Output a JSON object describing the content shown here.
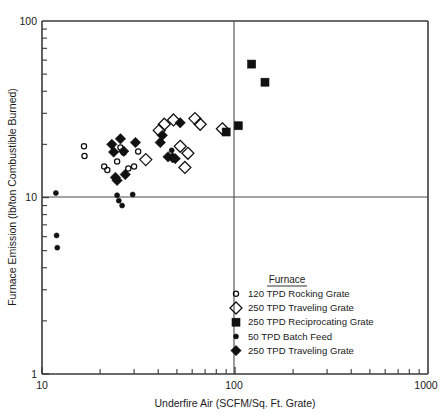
{
  "chart_data": {
    "type": "scatter",
    "title": "",
    "xlabel": "Underfire Air (SCFM/Sq. Ft. Grate)",
    "ylabel": "Furnace Emission (lb/ton Combustible Burned)",
    "xscale": "log",
    "yscale": "log",
    "xlim": [
      10,
      1000
    ],
    "ylim": [
      1,
      100
    ],
    "xticklabels": [
      "10",
      "100",
      "1000"
    ],
    "yticklabels": [
      "1",
      "10",
      "100"
    ],
    "grid": false,
    "reference_lines": [
      {
        "orientation": "vertical",
        "value": 100
      },
      {
        "orientation": "horizontal",
        "value": 10
      }
    ],
    "legend_title": "Furnace",
    "legend_position": "lower-right-inside",
    "series": [
      {
        "name": "120 TPD Rocking Grate",
        "marker": "open-circle",
        "points": [
          [
            16.5,
            19.5
          ],
          [
            16.6,
            17.2
          ],
          [
            21.0,
            15.0
          ],
          [
            21.8,
            14.3
          ],
          [
            24.5,
            16.0
          ],
          [
            25.5,
            19.2
          ],
          [
            26.5,
            18.0
          ],
          [
            28.0,
            14.6
          ],
          [
            30.0,
            15.0
          ],
          [
            31.5,
            18.2
          ]
        ]
      },
      {
        "name": "250 TPD Traveling Grate",
        "marker": "open-diamond",
        "points": [
          [
            34.5,
            16.4
          ],
          [
            40.5,
            24.0
          ],
          [
            43.0,
            26.0
          ],
          [
            48.0,
            27.5
          ],
          [
            52.0,
            19.5
          ],
          [
            55.0,
            14.8
          ],
          [
            57.0,
            17.8
          ],
          [
            62.0,
            28.0
          ],
          [
            66.0,
            26.0
          ],
          [
            86.0,
            24.5
          ]
        ]
      },
      {
        "name": "250 TPD Reciprocating Grate",
        "marker": "filled-square",
        "points": [
          [
            90.0,
            23.5
          ],
          [
            104.0,
            25.5
          ],
          [
            122.0,
            57.0
          ],
          [
            143.0,
            45.0
          ]
        ]
      },
      {
        "name": "50 TPD Batch Feed",
        "marker": "small-dot",
        "points": [
          [
            11.8,
            10.6
          ],
          [
            11.9,
            6.1
          ],
          [
            12.0,
            5.2
          ],
          [
            24.5,
            10.3
          ],
          [
            25.0,
            9.6
          ],
          [
            26.0,
            9.0
          ],
          [
            29.5,
            10.4
          ],
          [
            47.0,
            18.5
          ]
        ]
      },
      {
        "name": "250 TPD Traveling Grate",
        "marker": "filled-diamond",
        "points": [
          [
            23.0,
            20.0
          ],
          [
            23.5,
            18.1
          ],
          [
            24.0,
            13.0
          ],
          [
            24.5,
            12.5
          ],
          [
            25.5,
            21.5
          ],
          [
            26.5,
            18.3
          ],
          [
            27.0,
            13.5
          ],
          [
            30.5,
            20.5
          ],
          [
            41.0,
            20.5
          ],
          [
            42.0,
            22.5
          ],
          [
            45.0,
            17.0
          ],
          [
            47.5,
            16.8
          ],
          [
            49.0,
            16.6
          ],
          [
            52.0,
            26.5
          ]
        ]
      }
    ],
    "legend_entries": [
      {
        "marker": "open-circle",
        "label": "120 TPD Rocking Grate"
      },
      {
        "marker": "open-diamond",
        "label": "250 TPD Traveling Grate"
      },
      {
        "marker": "filled-square",
        "label": "250 TPD Reciprocating Grate"
      },
      {
        "marker": "small-dot",
        "label": "50 TPD Batch Feed"
      },
      {
        "marker": "filled-diamond",
        "label": "250 TPD Traveling Grate"
      }
    ]
  }
}
